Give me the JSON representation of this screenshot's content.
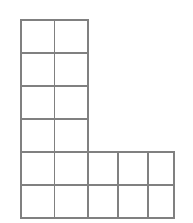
{
  "figure": {
    "shape_name": "L-shape",
    "background_color": "#ffffff",
    "line_color": "#808080",
    "line_width": 1.5,
    "cell_fill": "#ffffff",
    "origin": {
      "x": 21,
      "y": 20
    },
    "cell_size": {
      "width": 33.4,
      "height": 33.0
    },
    "grid": {
      "columns": 5,
      "rows": 6,
      "total_cells": 18
    },
    "arms": {
      "vertical": {
        "columns": 2,
        "rows": 4,
        "cells": 8
      },
      "base": {
        "columns": 5,
        "rows": 2,
        "cells": 10
      }
    },
    "column_x": [
      21,
      54.4,
      87.8,
      117.8,
      147.8,
      174.0
    ],
    "row_y": [
      20,
      53,
      86,
      119,
      152,
      185,
      218
    ],
    "cells": [
      {
        "row": 0,
        "col": 0
      },
      {
        "row": 0,
        "col": 1
      },
      {
        "row": 1,
        "col": 0
      },
      {
        "row": 1,
        "col": 1
      },
      {
        "row": 2,
        "col": 0
      },
      {
        "row": 2,
        "col": 1
      },
      {
        "row": 3,
        "col": 0
      },
      {
        "row": 3,
        "col": 1
      },
      {
        "row": 4,
        "col": 0
      },
      {
        "row": 4,
        "col": 1
      },
      {
        "row": 4,
        "col": 2
      },
      {
        "row": 4,
        "col": 3
      },
      {
        "row": 4,
        "col": 4
      },
      {
        "row": 5,
        "col": 0
      },
      {
        "row": 5,
        "col": 1
      },
      {
        "row": 5,
        "col": 2
      },
      {
        "row": 5,
        "col": 3
      },
      {
        "row": 5,
        "col": 4
      }
    ],
    "outline_path": "M 21 20 L 87.8 20 L 87.8 152 L 174 152 L 174 218 L 21 218 Z",
    "interior_lines": [
      {
        "orientation": "vertical",
        "x1": 54.4,
        "y1": 20,
        "x2": 54.4,
        "y2": 218
      },
      {
        "orientation": "vertical",
        "x1": 87.8,
        "y1": 152,
        "x2": 87.8,
        "y2": 218
      },
      {
        "orientation": "vertical",
        "x1": 117.8,
        "y1": 152,
        "x2": 117.8,
        "y2": 218
      },
      {
        "orientation": "vertical",
        "x1": 147.8,
        "y1": 152,
        "x2": 147.8,
        "y2": 218
      },
      {
        "orientation": "horizontal",
        "x1": 21,
        "y1": 53,
        "x2": 87.8,
        "y2": 53
      },
      {
        "orientation": "horizontal",
        "x1": 21,
        "y1": 86,
        "x2": 87.8,
        "y2": 86
      },
      {
        "orientation": "horizontal",
        "x1": 21,
        "y1": 119,
        "x2": 87.8,
        "y2": 119
      },
      {
        "orientation": "horizontal",
        "x1": 21,
        "y1": 152,
        "x2": 174,
        "y2": 152
      },
      {
        "orientation": "horizontal",
        "x1": 21,
        "y1": 185,
        "x2": 174,
        "y2": 185
      }
    ]
  }
}
